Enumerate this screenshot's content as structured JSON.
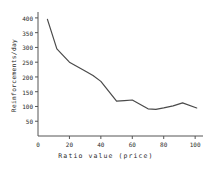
{
  "chart_data": {
    "type": "line",
    "title": "",
    "xlabel": "Ratio value (price)",
    "ylabel": "Reinforcements/day",
    "xlim": [
      0,
      105
    ],
    "ylim": [
      0,
      420
    ],
    "grid": false,
    "legend": null,
    "xticks": [
      0,
      20,
      40,
      60,
      80,
      100
    ],
    "xtick_labels": [
      "0",
      "20",
      "40",
      "60",
      "80",
      "100"
    ],
    "yticks": [
      50,
      100,
      150,
      200,
      250,
      300,
      350,
      400
    ],
    "ytick_labels": [
      "50",
      "100",
      "150",
      "200",
      "250",
      "300",
      "350",
      "400"
    ],
    "series": [
      {
        "name": "Reinforcements per day",
        "color": "#4a4a4a",
        "x": [
          6,
          12,
          20,
          30,
          35,
          40,
          50,
          55,
          60,
          70,
          75,
          80,
          86,
          92,
          101
        ],
        "values": [
          395,
          295,
          250,
          220,
          205,
          185,
          118,
          120,
          122,
          92,
          90,
          95,
          102,
          112,
          95
        ]
      }
    ]
  }
}
